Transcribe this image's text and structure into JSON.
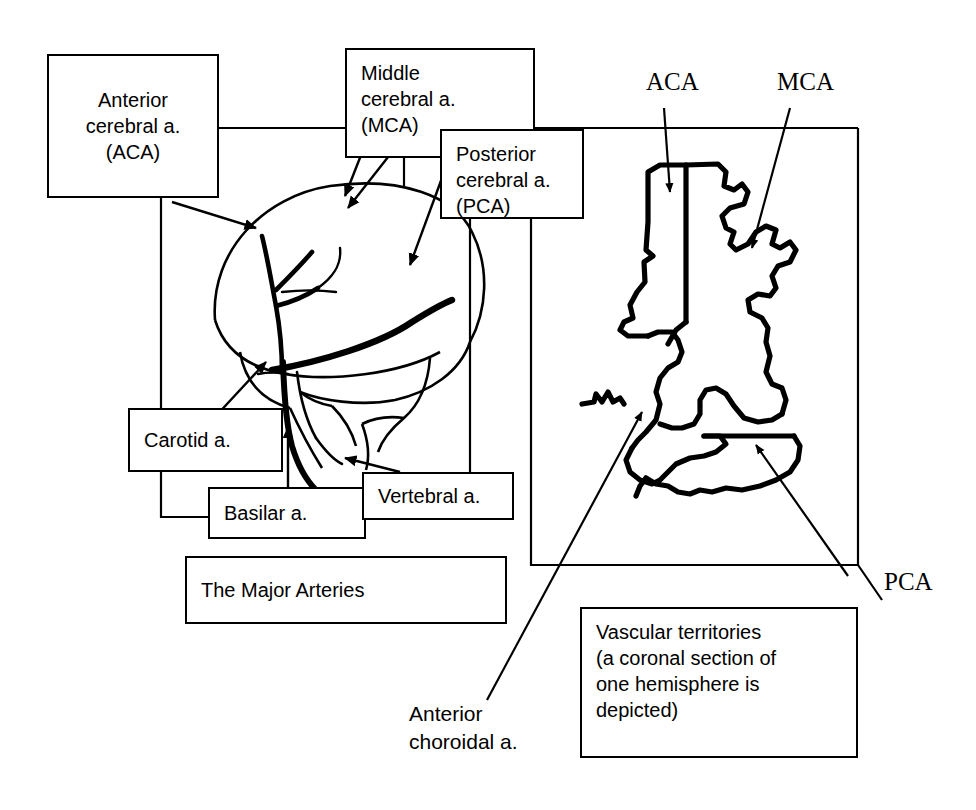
{
  "figure": {
    "title_box": "The Major Arteries",
    "caption_box": "Vascular territories\n(a coronal section of\none hemisphere is\ndepicted)"
  },
  "left_panel": {
    "name": "lateral-brain-view",
    "boxes": [
      {
        "id": "aca",
        "label": "Anterior\ncerebral a.\n(ACA)"
      },
      {
        "id": "mca",
        "label": "Middle\ncerebral a.\n(MCA)"
      },
      {
        "id": "pca",
        "label": "Posterior\ncerebral a.\n(PCA)"
      },
      {
        "id": "carotid",
        "label": "Carotid a."
      },
      {
        "id": "basilar",
        "label": "Basilar a."
      },
      {
        "id": "vertebral",
        "label": "Vertebral a."
      }
    ]
  },
  "right_panel": {
    "name": "coronal-section-view",
    "callouts": [
      {
        "id": "aca-territory",
        "label": "ACA"
      },
      {
        "id": "mca-territory",
        "label": "MCA"
      },
      {
        "id": "pca-territory",
        "label": "PCA"
      }
    ],
    "anterior_choroidal": "Anterior\nchoroidal a."
  },
  "style": {
    "ink": "#000000",
    "paper": "#ffffff",
    "vessel_stroke": "#000000"
  }
}
